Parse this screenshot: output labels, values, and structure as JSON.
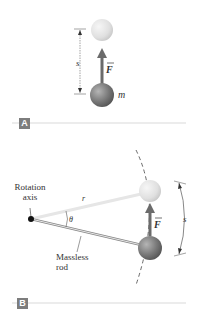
{
  "panel_a": {
    "tag": "A",
    "labels": {
      "displacement": "s",
      "force": "F",
      "mass": "m"
    }
  },
  "panel_b": {
    "tag": "B",
    "labels": {
      "axis_line1": "Rotation",
      "axis_line2": "axis",
      "radius": "r",
      "angle": "θ",
      "force": "F",
      "rod_line1": "Massless",
      "rod_line2": "rod",
      "arc": "s"
    }
  },
  "colors": {
    "ball_dark": "#7a7a7a",
    "ball_light": "#e2e2e2",
    "arrow": "#6b6b6b",
    "tag_bg": "#7d7d7d",
    "divider": "#d9d9d9"
  }
}
